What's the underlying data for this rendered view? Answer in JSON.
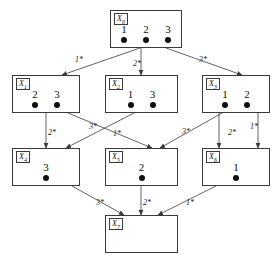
{
  "diagram": {
    "type": "hasse-lattice",
    "canvas": {
      "width": 280,
      "height": 267
    },
    "colors": {
      "background": "#ffffff",
      "stroke": "#3a3a3a",
      "dot": "#101010",
      "text": "#111111"
    },
    "nodes": [
      {
        "id": "X0",
        "label": "X",
        "subscript": "0",
        "elements": [
          "1",
          "2",
          "3"
        ],
        "dots": 3,
        "x": 110,
        "y": 10,
        "w": 72,
        "h": 38
      },
      {
        "id": "X1",
        "label": "X",
        "subscript": "1",
        "elements": [
          "2",
          "3"
        ],
        "dots": 2,
        "x": 12,
        "y": 75,
        "w": 68,
        "h": 38
      },
      {
        "id": "X2",
        "label": "X",
        "subscript": "2",
        "elements": [
          "1",
          "3"
        ],
        "dots": 2,
        "x": 105,
        "y": 75,
        "w": 73,
        "h": 38
      },
      {
        "id": "X3",
        "label": "X",
        "subscript": "3",
        "elements": [
          "1",
          "2"
        ],
        "dots": 2,
        "x": 202,
        "y": 75,
        "w": 68,
        "h": 38
      },
      {
        "id": "X4",
        "label": "X",
        "subscript": "4",
        "elements": [
          "3"
        ],
        "dots": 1,
        "x": 12,
        "y": 148,
        "w": 68,
        "h": 38
      },
      {
        "id": "X5",
        "label": "X",
        "subscript": "5",
        "elements": [
          "2"
        ],
        "dots": 1,
        "x": 105,
        "y": 148,
        "w": 73,
        "h": 38
      },
      {
        "id": "X6",
        "label": "X",
        "subscript": "6",
        "elements": [
          "1"
        ],
        "dots": 1,
        "x": 202,
        "y": 148,
        "w": 68,
        "h": 38
      },
      {
        "id": "X7",
        "label": "X",
        "subscript": "7",
        "elements": [],
        "dots": 0,
        "x": 105,
        "y": 215,
        "w": 73,
        "h": 38
      }
    ],
    "edges": [
      {
        "from": "X0",
        "to": "X1",
        "label": "1*",
        "lx": 75,
        "ly": 56
      },
      {
        "from": "X0",
        "to": "X2",
        "label": "2*",
        "lx": 133,
        "ly": 60
      },
      {
        "from": "X0",
        "to": "X3",
        "label": "3*",
        "lx": 199,
        "ly": 56
      },
      {
        "from": "X1",
        "to": "X4",
        "label": "2*",
        "lx": 48,
        "ly": 129
      },
      {
        "from": "X1",
        "to": "X5",
        "label": "3*",
        "lx": 89,
        "ly": 123
      },
      {
        "from": "X2",
        "to": "X4",
        "label": "1*",
        "lx": 113,
        "ly": 130
      },
      {
        "from": "X2",
        "to": "X6",
        "label": "2*",
        "lx": 228,
        "ly": 129
      },
      {
        "from": "X3",
        "to": "X5",
        "label": "3*",
        "lx": 182,
        "ly": 128
      },
      {
        "from": "X3",
        "to": "X6",
        "label": "1*",
        "lx": 250,
        "ly": 123
      },
      {
        "from": "X4",
        "to": "X7",
        "label": "3*",
        "lx": 96,
        "ly": 199
      },
      {
        "from": "X5",
        "to": "X7",
        "label": "2*",
        "lx": 143,
        "ly": 199
      },
      {
        "from": "X6",
        "to": "X7",
        "label": "1*",
        "lx": 186,
        "ly": 199
      }
    ],
    "edge_paths": [
      {
        "name": "edge-X0-X1",
        "x1": 140,
        "y1": 48,
        "x2": 62,
        "y2": 75
      },
      {
        "name": "edge-X0-X2",
        "x1": 141,
        "y1": 48,
        "x2": 141,
        "y2": 75
      },
      {
        "name": "edge-X0-X3",
        "x1": 166,
        "y1": 48,
        "x2": 242,
        "y2": 75
      },
      {
        "name": "edge-X1-X4",
        "x1": 46,
        "y1": 113,
        "x2": 46,
        "y2": 148
      },
      {
        "name": "edge-X1-X5",
        "x1": 68,
        "y1": 113,
        "x2": 152,
        "y2": 148
      },
      {
        "name": "edge-X2-X4",
        "x1": 134,
        "y1": 113,
        "x2": 66,
        "y2": 148
      },
      {
        "name": "edge-X2-X6",
        "x1": 219,
        "y1": 113,
        "x2": 219,
        "y2": 148
      },
      {
        "name": "edge-X3-X5",
        "x1": 222,
        "y1": 113,
        "x2": 160,
        "y2": 148
      },
      {
        "name": "edge-X3-X6",
        "x1": 258,
        "y1": 113,
        "x2": 258,
        "y2": 148
      },
      {
        "name": "edge-X4-X7",
        "x1": 72,
        "y1": 186,
        "x2": 124,
        "y2": 215
      },
      {
        "name": "edge-X5-X7",
        "x1": 141,
        "y1": 186,
        "x2": 141,
        "y2": 215
      },
      {
        "name": "edge-X6-X7",
        "x1": 216,
        "y1": 186,
        "x2": 158,
        "y2": 215
      }
    ]
  }
}
